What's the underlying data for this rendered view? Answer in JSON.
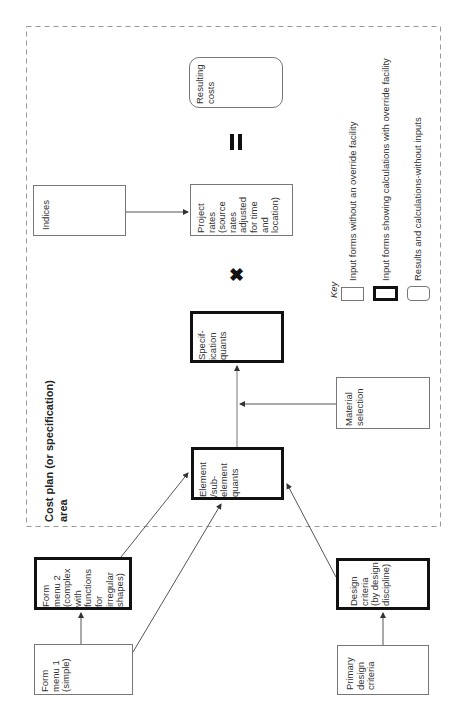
{
  "diagram": {
    "area_title": "Cost plan (or specification) area",
    "nodes": {
      "form_menu_1": "Form\nmenu 1\n(simple)",
      "form_menu_2": "Form\nmenu 2\n(complex\nwith\nfunctions\nfor\nirregular\nshapes)",
      "primary_design_criteria": "Primary\ndesign\ncriteria",
      "design_criteria": "Design\ncriteria\n(by design\ndiscipline)",
      "element_quants": "Element\n/sub-\nelement\nquants",
      "material_selection": "Material\nselection",
      "specification_quants": "Specif-\nication\nquants",
      "indices": "Indices",
      "project_rates": "Project\nrates\n(source\nrates\nadjusted\nfor time\nand\nlocation)",
      "resulting_costs": "Resulting\ncosts"
    },
    "operators": {
      "multiply": "✖",
      "equals": "="
    },
    "key": {
      "title": "Key",
      "items": [
        {
          "style": "plain",
          "label": "Input forms without an override facility"
        },
        {
          "style": "thick",
          "label": "Input forms showing calculations with override facility"
        },
        {
          "style": "rounded",
          "label": "Results and calculations-without inputs"
        }
      ]
    }
  }
}
